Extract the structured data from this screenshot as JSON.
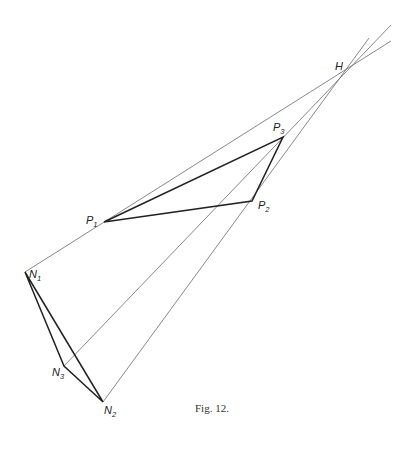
{
  "figure": {
    "caption": "Fig. 12.",
    "colors": {
      "thin_line": "#6a6a6a",
      "thick_line": "#222222",
      "background": "#ffffff"
    },
    "points": {
      "H": {
        "label": "H",
        "sub": "",
        "x": 347,
        "y": 68
      },
      "P1": {
        "label": "P",
        "sub": "1",
        "x": 104,
        "y": 222
      },
      "P2": {
        "label": "P",
        "sub": "2",
        "x": 252,
        "y": 201
      },
      "P3": {
        "label": "P",
        "sub": "3",
        "x": 283,
        "y": 137
      },
      "N1": {
        "label": "N",
        "sub": "1",
        "x": 25,
        "y": 272
      },
      "N2": {
        "label": "N",
        "sub": "2",
        "x": 103,
        "y": 402
      },
      "N3": {
        "label": "N",
        "sub": "3",
        "x": 64,
        "y": 366
      }
    },
    "thin_lines": [
      "N1 through P1 to H and beyond",
      "N3 through P2 to H and beyond",
      "N2 through P3 to H and beyond",
      "P1 to P3 (via H line)"
    ],
    "thick_triangles": [
      [
        "P1",
        "P2",
        "P3"
      ],
      [
        "N1",
        "N2",
        "N3"
      ]
    ]
  }
}
